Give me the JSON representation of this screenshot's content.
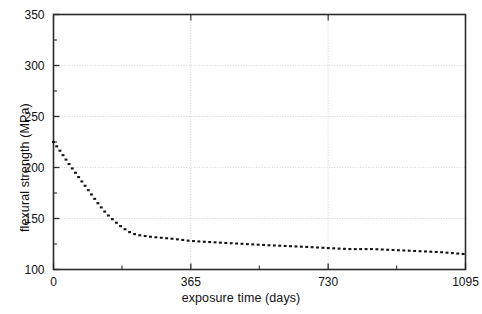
{
  "chart_data": {
    "type": "line",
    "title": "",
    "xlabel": "exposure time (days)",
    "ylabel": "flexural strength (MPa)",
    "xlim": [
      0,
      1095
    ],
    "ylim": [
      100,
      350
    ],
    "grid": true,
    "legend": null,
    "line_style": "dotted",
    "line_color": "#141414",
    "x_ticks_major": [
      0,
      365,
      730,
      1095
    ],
    "x_tick_labels": [
      "0",
      "365",
      "730",
      "1095"
    ],
    "x_ticks_minor": [
      182,
      547,
      912
    ],
    "y_ticks_major": [
      100,
      150,
      200,
      250,
      300,
      350
    ],
    "y_tick_labels": [
      "100",
      "150",
      "200",
      "250",
      "300",
      "350"
    ],
    "y_ticks_minor": [
      125,
      175,
      225,
      275,
      325
    ],
    "series": [
      {
        "name": "flexural strength",
        "x": [
          0,
          20,
          40,
          60,
          80,
          100,
          120,
          140,
          160,
          180,
          200,
          220,
          240,
          260,
          290,
          320,
          365,
          410,
          460,
          510,
          560,
          620,
          680,
          730,
          790,
          850,
          910,
          970,
          1030,
          1095
        ],
        "values": [
          225,
          215,
          204,
          194,
          184,
          174,
          164,
          155,
          148,
          142,
          137,
          134,
          133,
          132,
          131,
          130,
          128,
          127,
          126,
          125,
          124,
          123,
          122,
          121,
          120,
          120,
          119,
          118,
          117,
          115
        ]
      }
    ],
    "annotations": []
  }
}
